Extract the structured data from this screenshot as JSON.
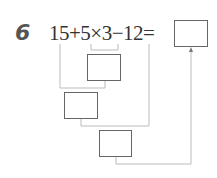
{
  "problem": {
    "number": "6",
    "expression": "15+5×3−12=",
    "steps": [
      {
        "id": "step1",
        "operation": "5×3"
      },
      {
        "id": "step2",
        "operation": "15+(step1)"
      },
      {
        "id": "step3",
        "operation": "(step2)−12"
      }
    ],
    "answer_box": ""
  }
}
